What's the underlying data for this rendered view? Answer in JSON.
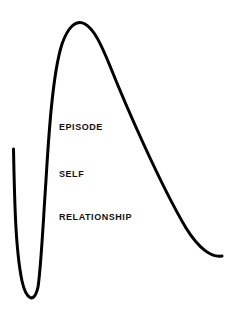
{
  "diagram": {
    "background_color": "#ffffff",
    "stroke_color": "#000000",
    "stroke_width": 3,
    "labels": [
      {
        "id": "episode",
        "text": "EPISODE",
        "x": 59,
        "y": 122
      },
      {
        "id": "self",
        "text": "SELF",
        "x": 59,
        "y": 169
      },
      {
        "id": "relationship",
        "text": "RELATIONSHIP",
        "x": 59,
        "y": 212
      }
    ],
    "curve": {
      "description": "Single continuous black stroke: descends from upper-left, bottoms out in a narrow U trough, rises steeply to a rounded peak near the top, then descends in a long gentle arc to the lower right.",
      "path": "M 13.5 149 C 14.5 200 15.5 250 22 281 C 26 299 34 305 38 287 C 41 268 43 225 46 180 C 49 130 53 72 62 44 C 68 27 76 19 85 24 C 94 29 101 44 110 66 C 126 106 160 184 186 228 C 199 249 212 258 222 256",
      "key_points": [
        {
          "name": "left-start",
          "x": 13,
          "y": 149
        },
        {
          "name": "trough",
          "x": 30,
          "y": 301
        },
        {
          "name": "peak",
          "x": 79,
          "y": 21
        },
        {
          "name": "right-end",
          "x": 222,
          "y": 256
        }
      ]
    }
  },
  "chart_data": {
    "type": "line",
    "title": "",
    "xlabel": "",
    "ylabel": "",
    "grid": false,
    "legend": "none",
    "annotations": [
      "EPISODE",
      "SELF",
      "RELATIONSHIP"
    ],
    "series": [
      {
        "name": "curve",
        "points": [
          [
            13,
            149
          ],
          [
            15,
            200
          ],
          [
            17,
            245
          ],
          [
            22,
            281
          ],
          [
            30,
            301
          ],
          [
            37,
            288
          ],
          [
            40,
            260
          ],
          [
            43,
            220
          ],
          [
            46,
            180
          ],
          [
            50,
            130
          ],
          [
            56,
            80
          ],
          [
            62,
            44
          ],
          [
            70,
            27
          ],
          [
            79,
            21
          ],
          [
            88,
            26
          ],
          [
            98,
            45
          ],
          [
            110,
            66
          ],
          [
            130,
            113
          ],
          [
            150,
            158
          ],
          [
            170,
            200
          ],
          [
            190,
            233
          ],
          [
            206,
            248
          ],
          [
            222,
            256
          ]
        ]
      }
    ]
  }
}
